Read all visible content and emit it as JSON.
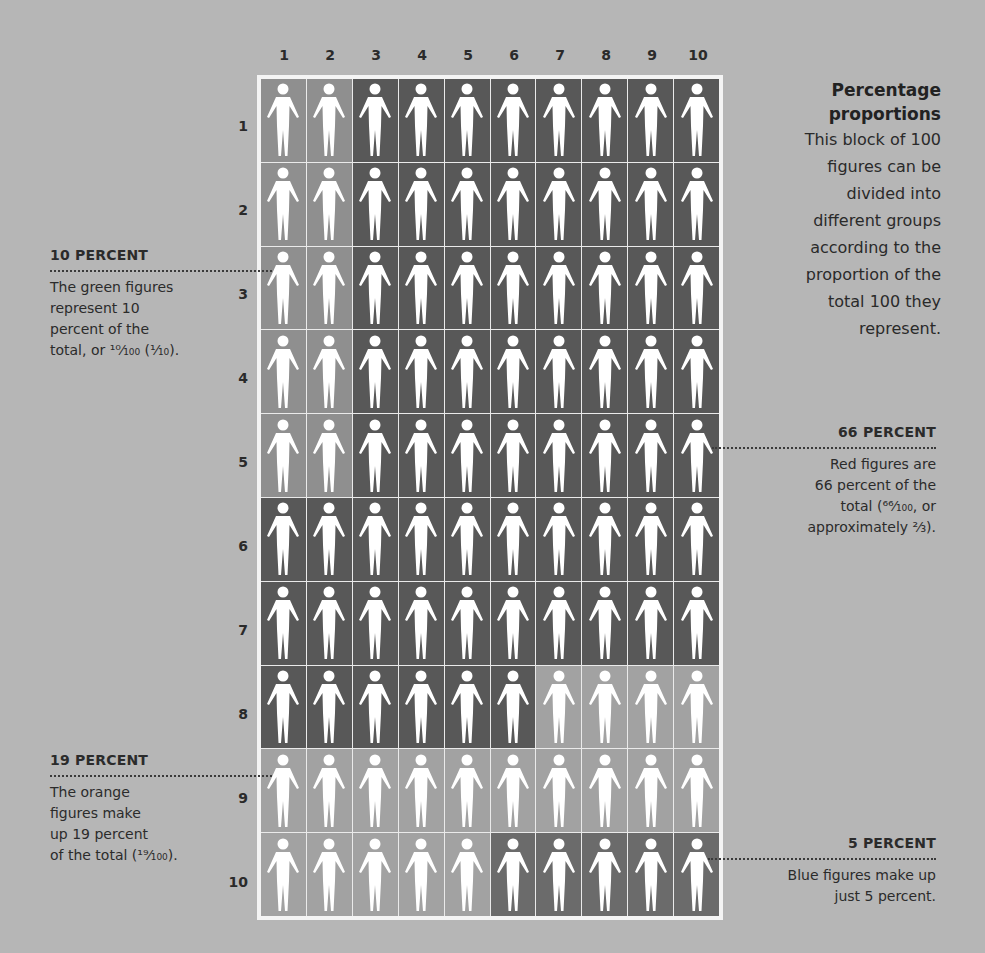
{
  "title": "Percentage proportions",
  "title_lines": [
    "Percentage",
    "proportions"
  ],
  "description_lines": [
    "This block of 100",
    "figures can be",
    "divided into",
    "different groups",
    "according to the",
    "proportion of the",
    "total 100 they",
    "represent."
  ],
  "column_labels": [
    "1",
    "2",
    "3",
    "4",
    "5",
    "6",
    "7",
    "8",
    "9",
    "10"
  ],
  "row_labels": [
    "1",
    "2",
    "3",
    "4",
    "5",
    "6",
    "7",
    "8",
    "9",
    "10"
  ],
  "colors": {
    "green": "#8f8f8f",
    "red": "#585858",
    "orange": "#a2a2a2",
    "blue": "#6b6b6b",
    "background": "#b6b6b6",
    "figure": "#ffffff"
  },
  "grid_groups": [
    [
      "green",
      "green",
      "red",
      "red",
      "red",
      "red",
      "red",
      "red",
      "red",
      "red"
    ],
    [
      "green",
      "green",
      "red",
      "red",
      "red",
      "red",
      "red",
      "red",
      "red",
      "red"
    ],
    [
      "green",
      "green",
      "red",
      "red",
      "red",
      "red",
      "red",
      "red",
      "red",
      "red"
    ],
    [
      "green",
      "green",
      "red",
      "red",
      "red",
      "red",
      "red",
      "red",
      "red",
      "red"
    ],
    [
      "green",
      "green",
      "red",
      "red",
      "red",
      "red",
      "red",
      "red",
      "red",
      "red"
    ],
    [
      "red",
      "red",
      "red",
      "red",
      "red",
      "red",
      "red",
      "red",
      "red",
      "red"
    ],
    [
      "red",
      "red",
      "red",
      "red",
      "red",
      "red",
      "red",
      "red",
      "red",
      "red"
    ],
    [
      "red",
      "red",
      "red",
      "red",
      "red",
      "red",
      "orange",
      "orange",
      "orange",
      "orange"
    ],
    [
      "orange",
      "orange",
      "orange",
      "orange",
      "orange",
      "orange",
      "orange",
      "orange",
      "orange",
      "orange"
    ],
    [
      "orange",
      "orange",
      "orange",
      "orange",
      "orange",
      "blue",
      "blue",
      "blue",
      "blue",
      "blue"
    ]
  ],
  "icon": "person-figure-icon",
  "annotations": {
    "green": {
      "heading": "10 PERCENT",
      "lines": [
        "The green figures",
        "represent 10",
        "percent of the",
        "total, or ¹⁰⁄₁₀₀ (¹⁄₁₀)."
      ]
    },
    "red": {
      "heading": "66 PERCENT",
      "lines": [
        "Red figures are",
        "66 percent of the",
        "total (⁶⁶⁄₁₀₀, or",
        "approximately ²⁄₃)."
      ]
    },
    "orange": {
      "heading": "19 PERCENT",
      "lines": [
        "The orange",
        "figures make",
        "up 19 percent",
        "of the total (¹⁹⁄₁₀₀)."
      ]
    },
    "blue": {
      "heading": "5 PERCENT",
      "lines": [
        "Blue figures make up",
        "just 5 percent."
      ]
    }
  },
  "chart_data": {
    "type": "pictogram",
    "title": "Percentage proportions",
    "grid": [
      10,
      10
    ],
    "total": 100,
    "categories": [
      "green",
      "red",
      "orange",
      "blue"
    ],
    "values": [
      10,
      66,
      19,
      5
    ],
    "labels": [
      "10 PERCENT",
      "66 PERCENT",
      "19 PERCENT",
      "5 PERCENT"
    ],
    "fractions": [
      "10/100 (1/10)",
      "66/100 (approx 2/3)",
      "19/100",
      "5/100"
    ]
  }
}
